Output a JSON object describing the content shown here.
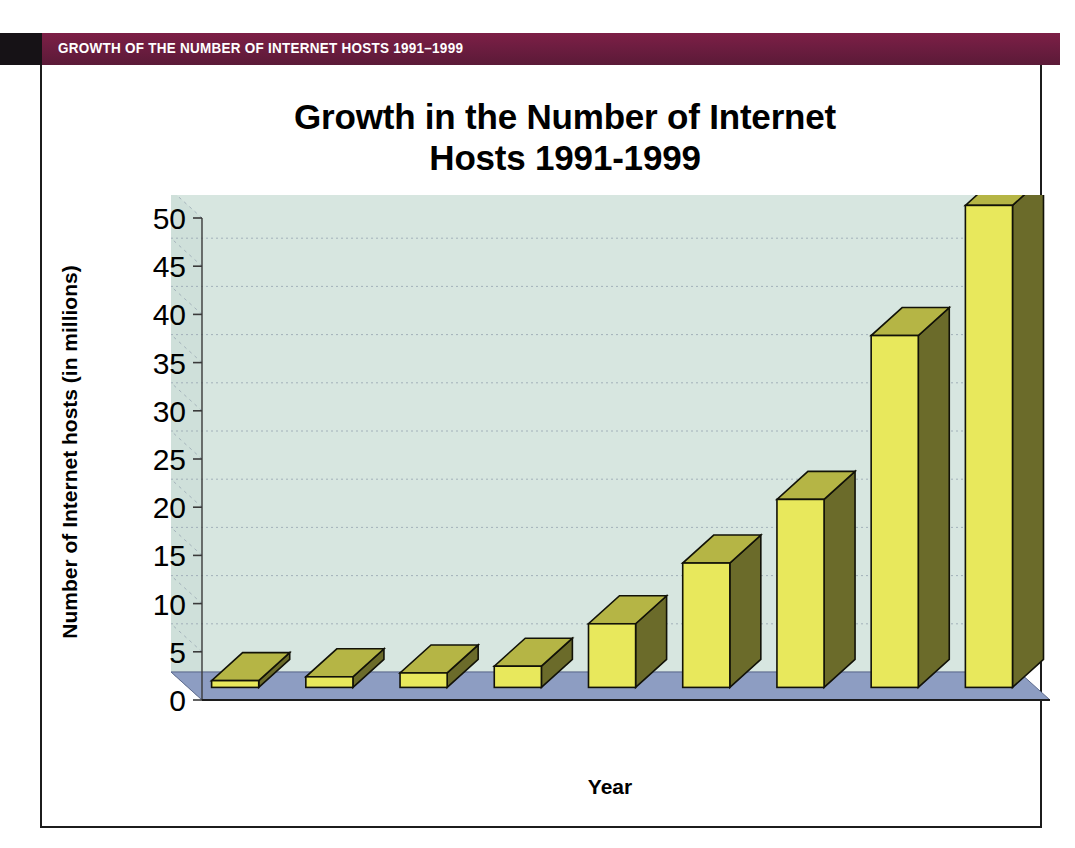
{
  "banner": {
    "title": "GROWTH OF THE NUMBER OF INTERNET HOSTS 1991–1999",
    "bar_color": "#6d1d40",
    "block_color": "#161216",
    "text_color": "#ffffff"
  },
  "chart_data": {
    "type": "bar",
    "title_line1": "Growth in the Number of Internet",
    "title_line2": "Hosts  1991-1999",
    "title": "Growth in the Number of Internet Hosts  1991-1999",
    "xlabel": "Year",
    "ylabel": "Number of Internet hosts (in millions)",
    "categories": [
      "1991",
      "1992",
      "1993",
      "1994",
      "1995",
      "1996",
      "1997",
      "1998",
      "1999"
    ],
    "values": [
      0.7,
      1.1,
      1.5,
      2.2,
      6.6,
      12.9,
      19.5,
      36.5,
      50.0
    ],
    "ylim": [
      0,
      50
    ],
    "yticks": [
      0,
      5,
      10,
      15,
      20,
      25,
      30,
      35,
      40,
      45,
      50
    ],
    "ytick_labels": [
      "0",
      "5",
      "10",
      "15",
      "20",
      "25",
      "30",
      "35",
      "40",
      "45",
      "50"
    ],
    "grid": true,
    "legend": "none",
    "style": "3d-column",
    "bar_face_color": "#e8e85c",
    "bar_side_color": "#6b6b2a",
    "bar_top_color": "#b5b545",
    "plot_back_color": "#d7e6e0",
    "floor_color": "#8d9dc2",
    "gridline_color": "#9aa8b4"
  }
}
